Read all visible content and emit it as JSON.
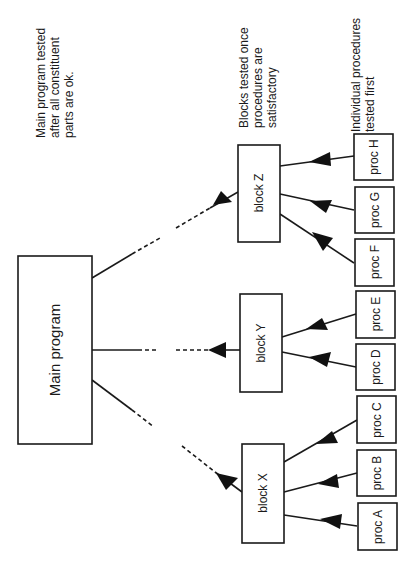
{
  "diagram": {
    "main": {
      "label": "Main program"
    },
    "blocks": [
      {
        "id": "Z",
        "label": "block Z"
      },
      {
        "id": "Y",
        "label": "block Y"
      },
      {
        "id": "X",
        "label": "block X"
      }
    ],
    "procs": [
      {
        "id": "H",
        "label": "proc H"
      },
      {
        "id": "G",
        "label": "proc G"
      },
      {
        "id": "F",
        "label": "proc F"
      },
      {
        "id": "E",
        "label": "proc E"
      },
      {
        "id": "D",
        "label": "proc D"
      },
      {
        "id": "C",
        "label": "proc C"
      },
      {
        "id": "B",
        "label": "proc B"
      },
      {
        "id": "A",
        "label": "proc A"
      }
    ],
    "notes": {
      "main": [
        "Main program tested",
        "after all constituent",
        "parts are ok."
      ],
      "blocks": [
        "Blocks tested once",
        "procedures are",
        "satisfactory"
      ],
      "procs": [
        "Individual procedures",
        "tested first"
      ]
    },
    "colors": {
      "line": "#1a1a1a",
      "background": "#ffffff"
    }
  }
}
